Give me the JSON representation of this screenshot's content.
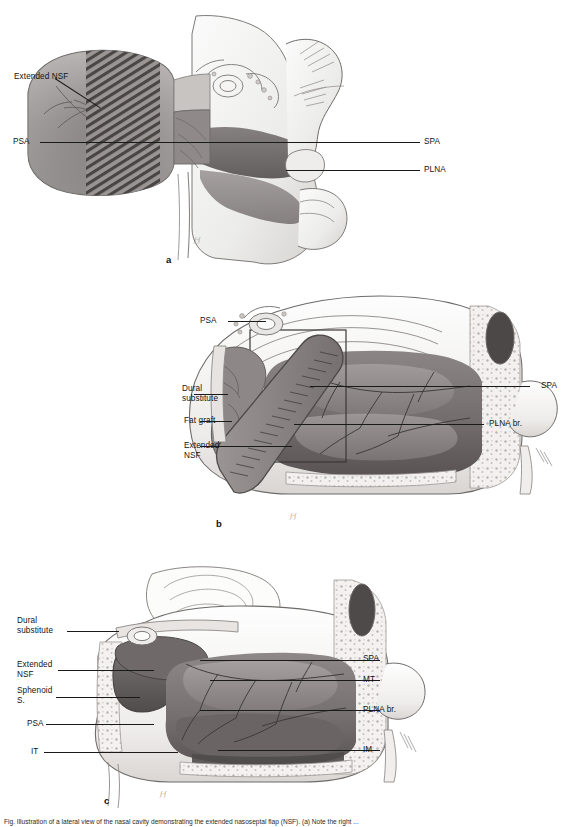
{
  "figure": {
    "caption": "Fig. Illustration of a lateral view of the nasal cavity demonstrating the extended nasoseptal flap (NSF). (a) Note the right ...",
    "panels": [
      {
        "letter": "a",
        "name": "panel-a",
        "labels_left": [
          {
            "text": "Extended NSF",
            "name": "label-extended-nsf"
          },
          {
            "text": "PSA",
            "name": "label-psa"
          }
        ],
        "labels_right": [
          {
            "text": "SPA",
            "name": "label-spa"
          },
          {
            "text": "PLNA",
            "name": "label-plna"
          }
        ]
      },
      {
        "letter": "b",
        "name": "panel-b",
        "labels_left": [
          {
            "text": "PSA",
            "name": "label-psa"
          },
          {
            "text": "Dural\nsubstitute",
            "name": "label-dural-substitute"
          },
          {
            "text": "Fat graft",
            "name": "label-fat-graft"
          },
          {
            "text": "Extended\nNSF",
            "name": "label-extended-nsf"
          }
        ],
        "labels_right": [
          {
            "text": "SPA",
            "name": "label-spa"
          },
          {
            "text": "PLNA br.",
            "name": "label-plna-br"
          }
        ]
      },
      {
        "letter": "c",
        "name": "panel-c",
        "labels_left": [
          {
            "text": "Dural\nsubstitute",
            "name": "label-dural-substitute"
          },
          {
            "text": "Extended\nNSF",
            "name": "label-extended-nsf"
          },
          {
            "text": "Sphenoid\nS.",
            "name": "label-sphenoid-sinus"
          },
          {
            "text": "PSA",
            "name": "label-psa"
          },
          {
            "text": "IT",
            "name": "label-it"
          }
        ],
        "labels_right": [
          {
            "text": "SPA",
            "name": "label-spa"
          },
          {
            "text": "MT",
            "name": "label-mt"
          },
          {
            "text": "PLNA br.",
            "name": "label-plna-br"
          },
          {
            "text": "IM",
            "name": "label-im"
          }
        ]
      }
    ],
    "artist_signature": "artist-signature",
    "colors": {
      "background": "#ffffff",
      "ink": "#1a1a1a",
      "mucosa_dark": "#6e6a6b",
      "mucosa_mid": "#8e8a8a",
      "mucosa_light": "#b9b5b4",
      "bone_light": "#e4e1df",
      "cartilage": "#f2f0ee",
      "flap": "#8a8687"
    }
  }
}
